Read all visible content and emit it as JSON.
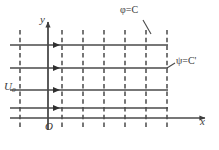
{
  "figure": {
    "background_color": "#ffffff",
    "line_color": "#4a4a4a",
    "dash_color": "#555555",
    "axes": {
      "x_label": "x",
      "y_label": "y",
      "origin_label": "O",
      "x_axis_y": 118,
      "y_axis_x": 48,
      "x_axis_start": 10,
      "x_axis_end": 205,
      "y_axis_top": 22,
      "y_axis_bottom": 130
    },
    "inflow": {
      "label": "U",
      "subscript": "0"
    },
    "annotations": [
      {
        "name": "equipotential-label",
        "text": "φ=C",
        "leader_from": [
          143,
          20
        ],
        "leader_to": [
          151,
          34
        ]
      },
      {
        "name": "streamline-label",
        "text": "ψ=C'",
        "leader_from": [
          175,
          63
        ],
        "leader_to": [
          167,
          68
        ]
      }
    ],
    "streamlines": {
      "description": "horizontal solid lines with flow arrows",
      "y_positions": [
        45,
        68,
        90,
        108
      ],
      "x_start": 10,
      "x_end": 168,
      "arrow_x": 60
    },
    "equipotentials": {
      "description": "vertical dashed lines",
      "x_positions": [
        20,
        62,
        83,
        104,
        125,
        146,
        167
      ],
      "y_top": 30,
      "y_bottom": 128
    }
  }
}
